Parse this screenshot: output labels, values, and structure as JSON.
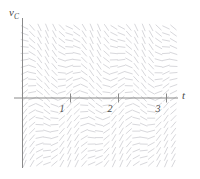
{
  "figure": {
    "kind": "direction-field-plot",
    "width": 200,
    "height": 179,
    "background": "#ffffff",
    "axis_color": "#8a8a8a",
    "label_color": "#4a4a4a",
    "field_color": "#d8d8dc"
  },
  "axes": {
    "y_label": "v",
    "y_label_sub": "C",
    "x_label": "t",
    "x_ticks": [
      "1",
      "2",
      "3"
    ]
  },
  "chart_data": {
    "type": "line",
    "subtype": "direction-field",
    "title": "",
    "xlabel": "t",
    "ylabel": "v_C",
    "xlim": [
      -0.45,
      3.45
    ],
    "ylim": [
      -1.55,
      1.6
    ],
    "grid": false,
    "legend": null,
    "x_ticks": [
      1,
      2,
      3
    ],
    "x_tick_labels": [
      "1",
      "2",
      "3"
    ],
    "y_ticks": [],
    "y_tick_labels": [],
    "origin_px": [
      22.5,
      98.0
    ],
    "x_unit_px": 48.0,
    "y_unit_px": 48.0,
    "slope_function": "dv/dt = cos(2*pi*t) - v",
    "field": {
      "nx": 26,
      "ny": 24,
      "x_start": -0.42,
      "x_step": 0.155,
      "y_start": -1.5,
      "y_step": 0.135,
      "segment_length_px": 7.2,
      "stroke_width": 1.0,
      "color": "#d8d8dc"
    },
    "annotations": [
      {
        "text": "v",
        "sub": "C",
        "x_px": 9,
        "y_px": 7,
        "role": "y-axis-label"
      },
      {
        "text": "t",
        "x_px": 182,
        "y_px": 90,
        "role": "x-axis-label"
      },
      {
        "text": "1",
        "x_px": 62,
        "y_px": 103,
        "role": "x-tick-label"
      },
      {
        "text": "2",
        "x_px": 110,
        "y_px": 103,
        "role": "x-tick-label"
      },
      {
        "text": "3",
        "x_px": 158,
        "y_px": 103,
        "role": "x-tick-label"
      }
    ]
  }
}
